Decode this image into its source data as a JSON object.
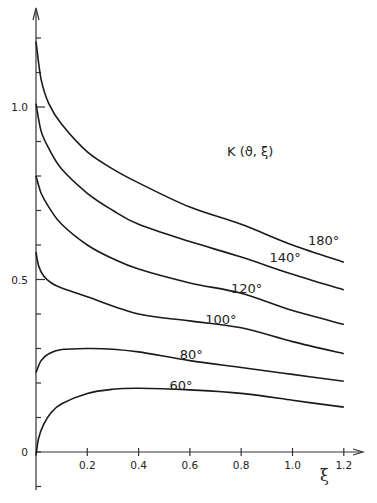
{
  "chart_data": {
    "type": "line",
    "title": "K (ϑ, ξ)",
    "xlabel": "ξ",
    "ylabel": "",
    "xlim": [
      0,
      1.25
    ],
    "ylim": [
      -0.1,
      1.3
    ],
    "grid": false,
    "legend": "inline labels at right end of curves",
    "x_ticks": [
      0.2,
      0.4,
      0.6,
      0.8,
      1.0,
      1.2
    ],
    "x_tick_labels": [
      "0.2",
      "0.4",
      "0.6",
      "0.8",
      "1.0",
      "1.2"
    ],
    "y_ticks": [
      -0.1,
      0,
      0.1,
      0.2,
      0.3,
      0.4,
      0.5,
      0.6,
      0.7,
      0.8,
      0.9,
      1.0,
      1.1,
      1.2
    ],
    "y_tick_labels": [
      {
        "value": 0,
        "label": "0"
      },
      {
        "value": 0.5,
        "label": "0.5"
      },
      {
        "value": 1.0,
        "label": "1.0"
      }
    ],
    "series": [
      {
        "name": "180°",
        "label": "180°",
        "points": [
          [
            0,
            1.19
          ],
          [
            0.02,
            1.08
          ],
          [
            0.05,
            1.01
          ],
          [
            0.1,
            0.95
          ],
          [
            0.2,
            0.87
          ],
          [
            0.3,
            0.82
          ],
          [
            0.4,
            0.78
          ],
          [
            0.6,
            0.71
          ],
          [
            0.8,
            0.66
          ],
          [
            1.0,
            0.6
          ],
          [
            1.2,
            0.55
          ]
        ]
      },
      {
        "name": "140°",
        "label": "140°",
        "points": [
          [
            0,
            1.01
          ],
          [
            0.02,
            0.93
          ],
          [
            0.05,
            0.88
          ],
          [
            0.1,
            0.82
          ],
          [
            0.2,
            0.75
          ],
          [
            0.3,
            0.7
          ],
          [
            0.4,
            0.66
          ],
          [
            0.6,
            0.61
          ],
          [
            0.8,
            0.565
          ],
          [
            1.0,
            0.515
          ],
          [
            1.2,
            0.47
          ]
        ]
      },
      {
        "name": "120°",
        "label": "120°",
        "points": [
          [
            0,
            0.8
          ],
          [
            0.02,
            0.75
          ],
          [
            0.05,
            0.71
          ],
          [
            0.1,
            0.66
          ],
          [
            0.2,
            0.6
          ],
          [
            0.3,
            0.56
          ],
          [
            0.4,
            0.53
          ],
          [
            0.6,
            0.49
          ],
          [
            0.8,
            0.46
          ],
          [
            1.0,
            0.41
          ],
          [
            1.2,
            0.37
          ]
        ]
      },
      {
        "name": "100°",
        "label": "100°",
        "points": [
          [
            0,
            0.58
          ],
          [
            0.01,
            0.54
          ],
          [
            0.03,
            0.51
          ],
          [
            0.06,
            0.49
          ],
          [
            0.1,
            0.475
          ],
          [
            0.2,
            0.45
          ],
          [
            0.4,
            0.4
          ],
          [
            0.6,
            0.38
          ],
          [
            0.8,
            0.36
          ],
          [
            1.0,
            0.32
          ],
          [
            1.2,
            0.285
          ]
        ]
      },
      {
        "name": "80°",
        "label": "80°",
        "points": [
          [
            0,
            0.23
          ],
          [
            0.02,
            0.265
          ],
          [
            0.05,
            0.285
          ],
          [
            0.1,
            0.297
          ],
          [
            0.2,
            0.3
          ],
          [
            0.3,
            0.298
          ],
          [
            0.4,
            0.29
          ],
          [
            0.6,
            0.265
          ],
          [
            0.8,
            0.245
          ],
          [
            1.0,
            0.225
          ],
          [
            1.2,
            0.205
          ]
        ]
      },
      {
        "name": "60°",
        "label": "60°",
        "points": [
          [
            0,
            -0.01
          ],
          [
            0.01,
            0.04
          ],
          [
            0.03,
            0.08
          ],
          [
            0.06,
            0.115
          ],
          [
            0.1,
            0.14
          ],
          [
            0.2,
            0.17
          ],
          [
            0.3,
            0.182
          ],
          [
            0.4,
            0.185
          ],
          [
            0.6,
            0.18
          ],
          [
            0.8,
            0.17
          ],
          [
            1.0,
            0.15
          ],
          [
            1.2,
            0.13
          ]
        ]
      }
    ],
    "labels": [
      {
        "text": "180°",
        "x": 1.06,
        "y": 0.6
      },
      {
        "text": "140°",
        "x": 0.91,
        "y": 0.55
      },
      {
        "text": "120°",
        "x": 0.76,
        "y": 0.46
      },
      {
        "text": "100°",
        "x": 0.66,
        "y": 0.37
      },
      {
        "text": "80°",
        "x": 0.56,
        "y": 0.27
      },
      {
        "text": "60°",
        "x": 0.52,
        "y": 0.18
      }
    ]
  },
  "chart_title": "K (ϑ, ξ)",
  "x_axis_symbol": "ξ"
}
